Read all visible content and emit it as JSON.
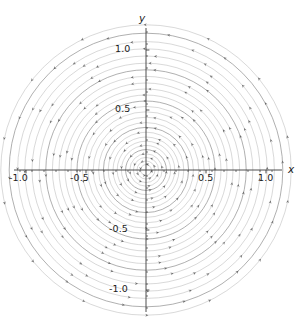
{
  "figure": {
    "background_color": "#ffffff",
    "axis_color": "#3a3a3a",
    "curve_color": "#8d8d8d",
    "arrow_color": "#5a5a5a"
  },
  "axes": {
    "x_axis_label": "x",
    "y_axis_label": "y",
    "x_ticks": [
      {
        "value": -1.0,
        "label": "-1.0"
      },
      {
        "value": -0.5,
        "label": "-0.5"
      },
      {
        "value": 0.5,
        "label": "0.5"
      },
      {
        "value": 1.0,
        "label": "1.0"
      }
    ],
    "y_ticks": [
      {
        "value": 1.0,
        "label": "1.0"
      },
      {
        "value": 0.5,
        "label": "0.5"
      },
      {
        "value": -0.5,
        "label": "-0.5"
      },
      {
        "value": -1.0,
        "label": "-1.0"
      }
    ],
    "minor_ticks_per_interval": 4,
    "origin_px": {
      "x": 146,
      "y": 170
    },
    "pixels_per_unit": 120
  },
  "chart_data": {
    "type": "line",
    "title": "",
    "subtitle": "",
    "xlabel": "x",
    "ylabel": "y",
    "xlim": [
      -1.22,
      1.22
    ],
    "ylim": [
      -1.26,
      1.26
    ],
    "grid": false,
    "legend": null,
    "annotations": [],
    "flow_direction": "clockwise",
    "center": [
      0,
      0
    ],
    "trajectory_radii": [
      0.045,
      0.075,
      0.105,
      0.135,
      0.17,
      0.205,
      0.24,
      0.275,
      0.315,
      0.355,
      0.395,
      0.44,
      0.485,
      0.53,
      0.575,
      0.625,
      0.675,
      0.725,
      0.78,
      0.835,
      0.89,
      0.95,
      1.01,
      1.07,
      1.14,
      1.21
    ],
    "series": [
      {
        "name": "streamline-family",
        "geometry": "concentric-circles",
        "values": [
          0.045,
          0.075,
          0.105,
          0.135,
          0.17,
          0.205,
          0.24,
          0.275,
          0.315,
          0.355,
          0.395,
          0.44,
          0.485,
          0.53,
          0.575,
          0.625,
          0.675,
          0.725,
          0.78,
          0.835,
          0.89,
          0.95,
          1.01,
          1.07,
          1.14,
          1.21
        ]
      }
    ]
  }
}
